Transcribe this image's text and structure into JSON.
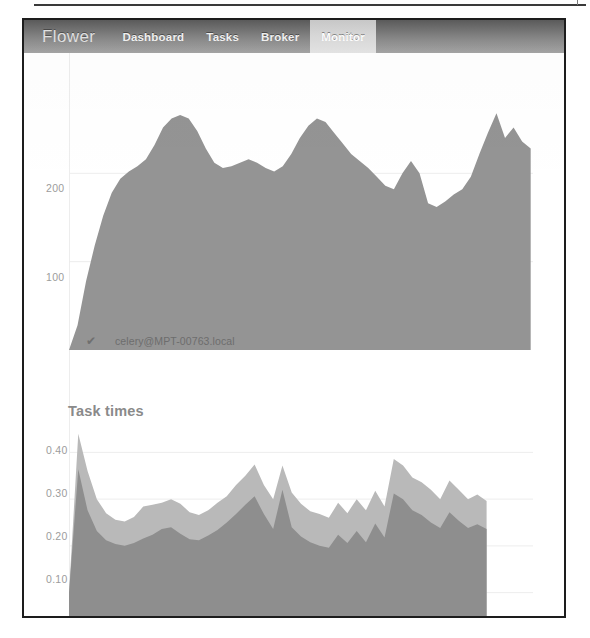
{
  "app": {
    "brand": "Flower",
    "nav_items": [
      {
        "label": "Dashboard",
        "active": false
      },
      {
        "label": "Tasks",
        "active": false
      },
      {
        "label": "Broker",
        "active": false
      },
      {
        "label": "Monitor",
        "active": true
      }
    ]
  },
  "colors": {
    "navbar_dark": "#5b5b5b",
    "navbar_light": "#a5a5a5",
    "active_tab_bg": "#d8d8d8",
    "series_primary": "#949494",
    "series_secondary": "#b9b9b9",
    "gridline": "#ededed",
    "axis_text": "#9c9c9c",
    "title_text": "#8a8a8a",
    "frame": "#1d1d1d"
  },
  "sections": {
    "succeeded_tasks": {
      "title": "",
      "legend": {
        "check_icon": "check-icon",
        "swatch_color": "#949494",
        "label": "celery@MPT-00763.local"
      }
    },
    "task_times": {
      "title": "Task times"
    }
  },
  "chart_data": [
    {
      "id": "succeeded-tasks-chart",
      "type": "area",
      "title": "",
      "xlabel": "",
      "ylabel": "",
      "grid": true,
      "legend_position": "bottom-left",
      "ylim": [
        0,
        300
      ],
      "yticks": [
        100,
        200
      ],
      "ytick_labels": [
        "100",
        "200"
      ],
      "series": [
        {
          "name": "celery@MPT-00763.local",
          "color": "#949494",
          "x": [
            0,
            1,
            2,
            3,
            4,
            5,
            6,
            7,
            8,
            9,
            10,
            11,
            12,
            13,
            14,
            15,
            16,
            17,
            18,
            19,
            20,
            21,
            22,
            23,
            24,
            25,
            26,
            27,
            28,
            29,
            30,
            31,
            32,
            33,
            34,
            35,
            36,
            37,
            38,
            39,
            40,
            41,
            42,
            43,
            44,
            45,
            46,
            47,
            48,
            49,
            50,
            51,
            52,
            53,
            54
          ],
          "values": [
            0,
            28,
            78,
            118,
            152,
            178,
            194,
            202,
            208,
            216,
            232,
            252,
            262,
            266,
            262,
            248,
            228,
            212,
            206,
            208,
            212,
            216,
            212,
            206,
            202,
            208,
            222,
            240,
            254,
            262,
            258,
            246,
            234,
            222,
            214,
            206,
            196,
            186,
            182,
            200,
            214,
            200,
            166,
            162,
            168,
            176,
            182,
            196,
            222,
            246,
            268,
            240,
            252,
            236,
            228
          ]
        }
      ]
    },
    {
      "id": "task-times-chart",
      "type": "area",
      "title": "Task times",
      "xlabel": "",
      "ylabel": "",
      "grid": true,
      "ylim": [
        0.05,
        0.45
      ],
      "yticks": [
        0.1,
        0.2,
        0.3,
        0.4
      ],
      "ytick_labels": [
        "0.10",
        "0.20",
        "0.30",
        "0.40"
      ],
      "series": [
        {
          "name": "upper-band",
          "color": "#b9b9b9",
          "x": [
            0,
            1,
            2,
            3,
            4,
            5,
            6,
            7,
            8,
            9,
            10,
            11,
            12,
            13,
            14,
            15,
            16,
            17,
            18,
            19,
            20,
            21,
            22,
            23,
            24,
            25,
            26,
            27,
            28,
            29,
            30,
            31,
            32,
            33,
            34,
            35,
            36,
            37,
            38,
            39,
            40,
            41,
            42,
            43,
            44,
            45
          ],
          "values": [
            0.1,
            0.44,
            0.36,
            0.3,
            0.27,
            0.256,
            0.252,
            0.262,
            0.284,
            0.288,
            0.292,
            0.3,
            0.29,
            0.272,
            0.266,
            0.276,
            0.292,
            0.306,
            0.33,
            0.35,
            0.374,
            0.33,
            0.3,
            0.372,
            0.314,
            0.29,
            0.274,
            0.268,
            0.26,
            0.292,
            0.27,
            0.3,
            0.276,
            0.318,
            0.284,
            0.386,
            0.372,
            0.346,
            0.336,
            0.32,
            0.3,
            0.34,
            0.32,
            0.3,
            0.31,
            0.296
          ]
        },
        {
          "name": "lower-band",
          "color": "#8e8e8e",
          "x": [
            0,
            1,
            2,
            3,
            4,
            5,
            6,
            7,
            8,
            9,
            10,
            11,
            12,
            13,
            14,
            15,
            16,
            17,
            18,
            19,
            20,
            21,
            22,
            23,
            24,
            25,
            26,
            27,
            28,
            29,
            30,
            31,
            32,
            33,
            34,
            35,
            36,
            37,
            38,
            39,
            40,
            41,
            42,
            43,
            44,
            45
          ],
          "values": [
            0.1,
            0.364,
            0.276,
            0.232,
            0.212,
            0.204,
            0.2,
            0.206,
            0.216,
            0.224,
            0.236,
            0.24,
            0.226,
            0.214,
            0.212,
            0.222,
            0.234,
            0.25,
            0.268,
            0.288,
            0.306,
            0.268,
            0.236,
            0.32,
            0.24,
            0.22,
            0.208,
            0.2,
            0.196,
            0.224,
            0.206,
            0.232,
            0.208,
            0.248,
            0.218,
            0.312,
            0.3,
            0.276,
            0.266,
            0.25,
            0.238,
            0.272,
            0.254,
            0.238,
            0.246,
            0.236
          ]
        }
      ]
    }
  ]
}
